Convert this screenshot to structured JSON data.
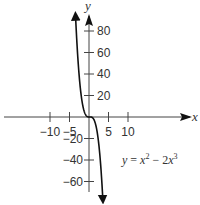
{
  "chart_data": {
    "type": "line",
    "title": "",
    "xlabel": "x",
    "ylabel": "y",
    "xlim": [
      -11,
      11
    ],
    "ylim": [
      -70,
      95
    ],
    "grid": false,
    "x_ticks": [
      -10,
      -5,
      5,
      10
    ],
    "x_tick_labels": [
      "−10",
      "−5",
      "5",
      "10"
    ],
    "y_ticks": [
      80,
      60,
      40,
      20,
      -20,
      -40,
      -60
    ],
    "y_tick_labels": [
      "80",
      "60",
      "40",
      "20",
      "−20",
      "−40",
      "−60"
    ],
    "series": [
      {
        "name": "y = x^2 - 2x^3",
        "function": "x^2 - 2*x^3",
        "x_range": [
          -3.45,
          3.55
        ],
        "x": [
          -3.45,
          -3,
          -2.5,
          -2,
          -1.5,
          -1,
          -0.5,
          0,
          0.5,
          1,
          1.5,
          2,
          2.5,
          3,
          3.55
        ],
        "values": [
          94.0,
          81.0,
          37.5,
          20.0,
          9.0,
          3.0,
          0.5,
          0,
          0.0,
          -1.0,
          -4.5,
          -12.0,
          -25.0,
          -45.0,
          -76.9
        ]
      }
    ],
    "annotations": [
      {
        "text": "y = x² − 2x³",
        "x": 6.5,
        "y": -40
      }
    ],
    "colors": {
      "curve": "#111111",
      "axis": "#444444",
      "text": "#333333"
    }
  },
  "labels": {
    "x_axis": "x",
    "y_axis": "y",
    "equation_y": "y",
    "equation_eq": " = ",
    "equation_x2": "x",
    "equation_sup2": "2",
    "equation_minus": " − 2",
    "equation_x3": "x",
    "equation_sup3": "3"
  }
}
